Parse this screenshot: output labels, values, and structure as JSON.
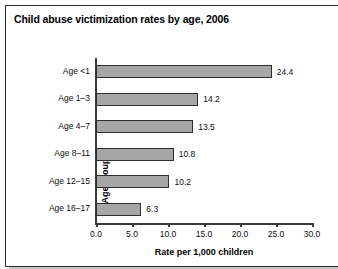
{
  "chart_data": {
    "type": "bar",
    "orientation": "horizontal",
    "title": "Child abuse victimization rates by age, 2006",
    "xlabel": "Rate per 1,000 children",
    "ylabel": "Age group",
    "categories": [
      "Age <1",
      "Age 1–3",
      "Age 4–7",
      "Age 8–11",
      "Age 12–15",
      "Age 16–17"
    ],
    "values": [
      24.4,
      14.2,
      13.5,
      10.8,
      10.2,
      6.3
    ],
    "value_labels": [
      "24.4",
      "14.2",
      "13.5",
      "10.8",
      "10.2",
      "6.3"
    ],
    "xlim": [
      0.0,
      30.0
    ],
    "xticks": [
      0.0,
      5.0,
      10.0,
      15.0,
      20.0,
      25.0,
      30.0
    ],
    "xtick_labels": [
      "0.0",
      "5.0",
      "10.0",
      "15.0",
      "20.0",
      "25.0",
      "30.0"
    ],
    "grid": false,
    "legend": false,
    "bar_color": "#a6a6a6",
    "bar_edge_color": "#2e2e2e",
    "axis_color": "#3a3a3a",
    "text_color": "#0d0d0d",
    "background_color": "#ffffff"
  }
}
